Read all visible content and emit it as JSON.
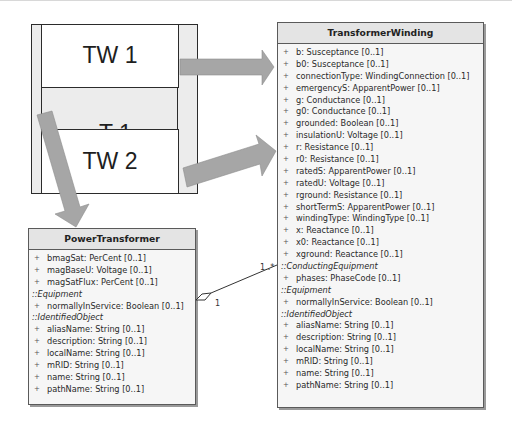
{
  "schematic": {
    "outer_label": "T 1",
    "winding_1_label": "TW 1",
    "winding_2_label": "TW 2"
  },
  "transformer_winding": {
    "title": "TransformerWinding",
    "rows": [
      {
        "kind": "attr",
        "text": "b:  Susceptance [0..1]"
      },
      {
        "kind": "attr",
        "text": "b0:  Susceptance [0..1]"
      },
      {
        "kind": "attr",
        "text": "connectionType:  WindingConnection [0..1]"
      },
      {
        "kind": "attr",
        "text": "emergencyS:  ApparentPower [0..1]"
      },
      {
        "kind": "attr",
        "text": "g:  Conductance [0..1]"
      },
      {
        "kind": "attr",
        "text": "g0:  Conductance [0..1]"
      },
      {
        "kind": "attr",
        "text": "grounded:  Boolean [0..1]"
      },
      {
        "kind": "attr",
        "text": "insulationU:  Voltage [0..1]"
      },
      {
        "kind": "attr",
        "text": "r:  Resistance [0..1]"
      },
      {
        "kind": "attr",
        "text": "r0:  Resistance [0..1]"
      },
      {
        "kind": "attr",
        "text": "ratedS:  ApparentPower [0..1]"
      },
      {
        "kind": "attr",
        "text": "ratedU:  Voltage [0..1]"
      },
      {
        "kind": "attr",
        "text": "rground:  Resistance [0..1]"
      },
      {
        "kind": "attr",
        "text": "shortTermS:  ApparentPower [0..1]"
      },
      {
        "kind": "attr",
        "text": "windingType:  WindingType [0..1]"
      },
      {
        "kind": "attr",
        "text": "x:  Reactance [0..1]"
      },
      {
        "kind": "attr",
        "text": "x0:  Reactance [0..1]"
      },
      {
        "kind": "attr",
        "text": "xground:  Reactance [0..1]"
      },
      {
        "kind": "section",
        "text": "::ConductingEquipment"
      },
      {
        "kind": "attr",
        "text": "phases:  PhaseCode [0..1]"
      },
      {
        "kind": "section",
        "text": "::Equipment"
      },
      {
        "kind": "attr",
        "text": "normallyInService:  Boolean [0..1]"
      },
      {
        "kind": "section",
        "text": "::IdentifiedObject"
      },
      {
        "kind": "attr",
        "text": "aliasName:  String [0..1]"
      },
      {
        "kind": "attr",
        "text": "description:  String [0..1]"
      },
      {
        "kind": "attr",
        "text": "localName:  String [0..1]"
      },
      {
        "kind": "attr",
        "text": "mRID:  String [0..1]"
      },
      {
        "kind": "attr",
        "text": "name:  String [0..1]"
      },
      {
        "kind": "attr",
        "text": "pathName:  String [0..1]"
      }
    ]
  },
  "power_transformer": {
    "title": "PowerTransformer",
    "rows": [
      {
        "kind": "attr",
        "text": "bmagSat:  PerCent [0..1]"
      },
      {
        "kind": "attr",
        "text": "magBaseU:  Voltage [0..1]"
      },
      {
        "kind": "attr",
        "text": "magSatFlux:  PerCent [0..1]"
      },
      {
        "kind": "section",
        "text": "::Equipment"
      },
      {
        "kind": "attr",
        "text": "normallyInService:  Boolean [0..1]"
      },
      {
        "kind": "section",
        "text": "::IdentifiedObject"
      },
      {
        "kind": "attr",
        "text": "aliasName:  String [0..1]"
      },
      {
        "kind": "attr",
        "text": "description:  String [0..1]"
      },
      {
        "kind": "attr",
        "text": "localName:  String [0..1]"
      },
      {
        "kind": "attr",
        "text": "mRID:  String [0..1]"
      },
      {
        "kind": "attr",
        "text": "name:  String [0..1]"
      },
      {
        "kind": "attr",
        "text": "pathName:  String [0..1]"
      }
    ]
  },
  "association": {
    "power_transformer_end_multiplicity": "1",
    "transformer_winding_end_multiplicity": "1..*"
  },
  "plus_symbol": "+",
  "colors": {
    "arrow_fill": "#a6a6a6",
    "outline": "#2b2b2b",
    "class_header": "#e4e4e4",
    "class_body": "#f6f6f6"
  }
}
